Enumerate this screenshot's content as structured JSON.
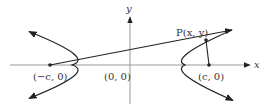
{
  "diagram": {
    "axis_labels": {
      "x": "x",
      "y": "y"
    },
    "points": {
      "left_focus": "(−c, 0)",
      "origin": "(0, 0)",
      "right_focus": "(c, 0)",
      "point_p": "P(x, y)"
    }
  }
}
